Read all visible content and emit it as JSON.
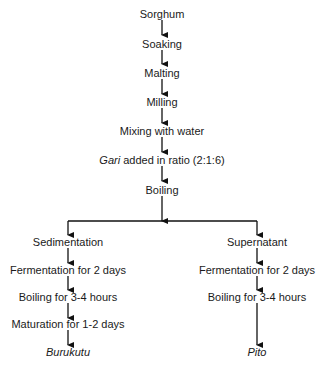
{
  "flowchart": {
    "main_steps": [
      "Sorghum",
      "Soaking",
      "Malting",
      "Milling",
      "Mixing with water"
    ],
    "gari_term": "Gari",
    "gari_rest": " added in ratio (2:1:6)",
    "boiling": "Boiling",
    "left_branch": {
      "steps": [
        "Sedimentation",
        "Fermentation for 2 days",
        "Boiling for 3-4 hours",
        "Maturation for 1-2 days"
      ],
      "product": "Burukutu"
    },
    "right_branch": {
      "steps": [
        "Supernatant",
        "Fermentation for 2 days",
        "Boiling for 3-4 hours"
      ],
      "product": "Pito"
    }
  }
}
